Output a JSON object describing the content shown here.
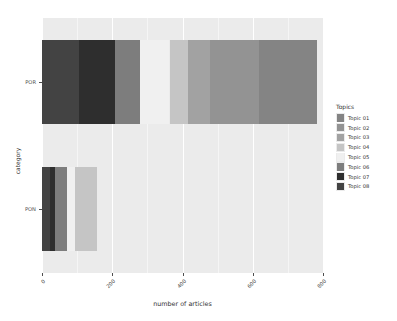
{
  "chart_data": {
    "type": "bar",
    "orientation": "horizontal",
    "stacked": true,
    "title": "",
    "xlabel": "number of articles",
    "ylabel": "category",
    "categories": [
      "PON",
      "POR"
    ],
    "xlim": [
      0,
      800
    ],
    "xticks": [
      0,
      200,
      400,
      600,
      800
    ],
    "xtick_labels": [
      "0",
      "200",
      "400",
      "600",
      "800"
    ],
    "grid": true,
    "legend": {
      "title": "Topics",
      "position": "right",
      "entries": [
        {
          "name": "Topic 01",
          "color": "#848484"
        },
        {
          "name": "Topic 02",
          "color": "#939393"
        },
        {
          "name": "Topic 03",
          "color": "#a2a2a2"
        },
        {
          "name": "Topic 04",
          "color": "#c5c5c5"
        },
        {
          "name": "Topic 05",
          "color": "#f0f0f0"
        },
        {
          "name": "Topic 06",
          "color": "#7d7d7d"
        },
        {
          "name": "Topic 07",
          "color": "#2e2e2e"
        },
        {
          "name": "Topic 08",
          "color": "#434343"
        }
      ]
    },
    "series": [
      {
        "name": "Topic 01",
        "color": "#848484",
        "values": [
          0,
          165
        ]
      },
      {
        "name": "Topic 02",
        "color": "#939393",
        "values": [
          0,
          140
        ]
      },
      {
        "name": "Topic 03",
        "color": "#a2a2a2",
        "values": [
          0,
          62
        ]
      },
      {
        "name": "Topic 04",
        "color": "#c5c5c5",
        "values": [
          64,
          53
        ]
      },
      {
        "name": "Topic 05",
        "color": "#f0f0f0",
        "values": [
          22,
          85
        ]
      },
      {
        "name": "Topic 06",
        "color": "#7d7d7d",
        "values": [
          34,
          69
        ]
      },
      {
        "name": "Topic 07",
        "color": "#2e2e2e",
        "values": [
          14,
          103
        ]
      },
      {
        "name": "Topic 08",
        "color": "#434343",
        "values": [
          23,
          106
        ]
      }
    ],
    "bars": [
      {
        "category": "POR",
        "segments": [
          {
            "topic": "Topic 08",
            "color": "#434343",
            "start": 0,
            "length": 106
          },
          {
            "topic": "Topic 07",
            "color": "#2e2e2e",
            "start": 106,
            "length": 103
          },
          {
            "topic": "Topic 06",
            "color": "#7d7d7d",
            "start": 209,
            "length": 69
          },
          {
            "topic": "Topic 05",
            "color": "#f0f0f0",
            "start": 278,
            "length": 85
          },
          {
            "topic": "Topic 04",
            "color": "#c5c5c5",
            "start": 363,
            "length": 53
          },
          {
            "topic": "Topic 03",
            "color": "#a2a2a2",
            "start": 416,
            "length": 62
          },
          {
            "topic": "Topic 02",
            "color": "#939393",
            "start": 478,
            "length": 140
          },
          {
            "topic": "Topic 01",
            "color": "#848484",
            "start": 618,
            "length": 165
          }
        ],
        "total": 783
      },
      {
        "category": "PON",
        "segments": [
          {
            "topic": "Topic 08",
            "color": "#434343",
            "start": 0,
            "length": 23
          },
          {
            "topic": "Topic 07",
            "color": "#2e2e2e",
            "start": 23,
            "length": 14
          },
          {
            "topic": "Topic 06",
            "color": "#7d7d7d",
            "start": 37,
            "length": 34
          },
          {
            "topic": "Topic 05",
            "color": "#f0f0f0",
            "start": 71,
            "length": 22
          },
          {
            "topic": "Topic 04",
            "color": "#c5c5c5",
            "start": 93,
            "length": 64
          }
        ],
        "total": 157
      }
    ],
    "panel_background": "#ebebeb",
    "gridline_color": "#ffffff"
  }
}
